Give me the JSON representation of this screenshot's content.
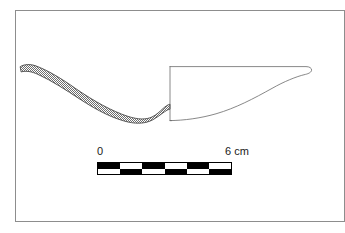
{
  "figure": {
    "kind": "archaeological-vessel-profile-drawing",
    "background_color": "#ffffff",
    "frame_color": "#8d8d8d",
    "ink_color": "#4a4a4a",
    "fill_pattern": "stipple-50-percent-dither",
    "fill_color": "#6e6e6e"
  },
  "vessel": {
    "centre_line_x": 170,
    "rim_left": {
      "x": 20,
      "y": 67
    },
    "rim_right": {
      "x": 311,
      "y": 68
    },
    "base_y": 120,
    "section_outer_path": "M20.5,66.5 C24,64.2 30,64.0 35,65.6 C48,70.2 62,79.0 76,88.8 C94,101.2 112,111.2 128,116.4 C138,119.6 146,119.8 152,117.0 C156.5,114.8 160,111.4 163,108.6 C165.5,106.2 168,104.6 170,104.2",
    "section_inner_path": "M21.5,71.8 C26,70.5 32,71.6 38,74.4 C52,80.8 66,90.0 80,99.2 C98,111.0 114,118.8 128,122.0 C138,124.2 146,123.2 152,120.2 C157,117.6 161,114.2 164.5,111.8 C166.8,110.2 168.6,109.4 170,109.2",
    "profile_path": "M170,66.6 L306,66.6 C309.4,66.6 311.6,68.0 311.6,70.0 C311.6,72.0 309.0,73.6 305.4,74.4 C296,76.6 284,81.6 272,88.4 C254,98.4 236,108.0 216,113.8 C200,118.4 184,120.4 170,120.6 Z",
    "centre_line": {
      "x1": 170,
      "y1": 66,
      "x2": 170,
      "y2": 121
    }
  },
  "scale": {
    "unit": "cm",
    "min_label": "0",
    "max_label": "6 cm",
    "min_value": 0,
    "max_value": 6,
    "segments": 6,
    "segment_length_cm": 1,
    "bar_left_px": 97,
    "bar_right_px": 232,
    "bar_top_px": 162,
    "bar_height_px": 13,
    "rows": [
      {
        "name": "top",
        "pattern": [
          "dark",
          "light",
          "dark",
          "light",
          "dark",
          "light"
        ]
      },
      {
        "name": "bottom",
        "pattern": [
          "light",
          "dark",
          "light",
          "dark",
          "light",
          "dark"
        ]
      }
    ],
    "colors": {
      "dark": "#000000",
      "light": "#ffffff",
      "outline": "#000000"
    }
  }
}
